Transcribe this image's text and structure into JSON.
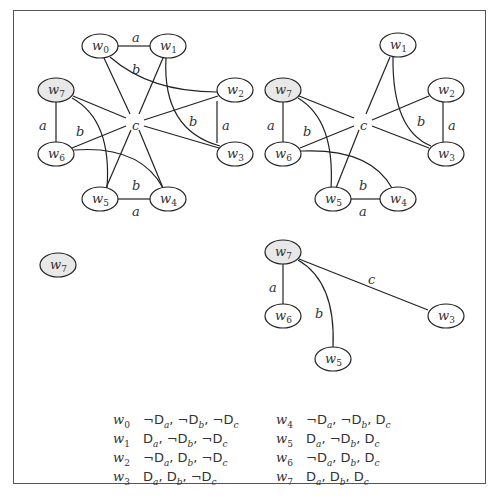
{
  "graphs": [
    {
      "id": "top-left",
      "center_label": "c",
      "nodes": [
        {
          "id": "w0",
          "label": "w",
          "sub": "0",
          "x": 100,
          "y": 46,
          "shaded": false
        },
        {
          "id": "w1",
          "label": "w",
          "sub": "1",
          "x": 168,
          "y": 46,
          "shaded": false
        },
        {
          "id": "w2",
          "label": "w",
          "sub": "2",
          "x": 235,
          "y": 90,
          "shaded": false
        },
        {
          "id": "w3",
          "label": "w",
          "sub": "3",
          "x": 235,
          "y": 154,
          "shaded": false
        },
        {
          "id": "w4",
          "label": "w",
          "sub": "4",
          "x": 168,
          "y": 199,
          "shaded": false
        },
        {
          "id": "w5",
          "label": "w",
          "sub": "5",
          "x": 100,
          "y": 199,
          "shaded": false
        },
        {
          "id": "w6",
          "label": "w",
          "sub": "6",
          "x": 56,
          "y": 154,
          "shaded": false
        },
        {
          "id": "w7",
          "label": "w",
          "sub": "7",
          "x": 56,
          "y": 90,
          "shaded": true
        }
      ],
      "edge_labels": [
        {
          "text": "a",
          "x": 135,
          "y": 38
        },
        {
          "text": "b",
          "x": 135,
          "y": 70
        },
        {
          "text": "a",
          "x": 42,
          "y": 126
        },
        {
          "text": "b",
          "x": 79,
          "y": 132
        },
        {
          "text": "c",
          "x": 135,
          "y": 126
        },
        {
          "text": "b",
          "x": 192,
          "y": 122
        },
        {
          "text": "a",
          "x": 225,
          "y": 126
        },
        {
          "text": "b",
          "x": 135,
          "y": 186
        },
        {
          "text": "a",
          "x": 135,
          "y": 212
        }
      ]
    },
    {
      "id": "top-right",
      "center_label": "c",
      "nodes": [
        {
          "id": "w1",
          "label": "w",
          "sub": "1",
          "x": 398,
          "y": 45,
          "shaded": false
        },
        {
          "id": "w2",
          "label": "w",
          "sub": "2",
          "x": 446,
          "y": 90,
          "shaded": false
        },
        {
          "id": "w3",
          "label": "w",
          "sub": "3",
          "x": 446,
          "y": 154,
          "shaded": false
        },
        {
          "id": "w4",
          "label": "w",
          "sub": "4",
          "x": 398,
          "y": 199,
          "shaded": false
        },
        {
          "id": "w5",
          "label": "w",
          "sub": "5",
          "x": 333,
          "y": 199,
          "shaded": false
        },
        {
          "id": "w6",
          "label": "w",
          "sub": "6",
          "x": 283,
          "y": 154,
          "shaded": false
        },
        {
          "id": "w7",
          "label": "w",
          "sub": "7",
          "x": 283,
          "y": 90,
          "shaded": true
        }
      ],
      "edge_labels": [
        {
          "text": "a",
          "x": 270,
          "y": 126
        },
        {
          "text": "b",
          "x": 306,
          "y": 132
        },
        {
          "text": "c",
          "x": 363,
          "y": 126
        },
        {
          "text": "b",
          "x": 420,
          "y": 122
        },
        {
          "text": "a",
          "x": 451,
          "y": 126
        },
        {
          "text": "b",
          "x": 362,
          "y": 186
        },
        {
          "text": "a",
          "x": 362,
          "y": 212
        }
      ]
    },
    {
      "id": "bottom-left",
      "nodes": [
        {
          "id": "w7",
          "label": "w",
          "sub": "7",
          "x": 58,
          "y": 265,
          "shaded": true
        }
      ],
      "edge_labels": []
    },
    {
      "id": "bottom-right",
      "nodes": [
        {
          "id": "w7",
          "label": "w",
          "sub": "7",
          "x": 283,
          "y": 252,
          "shaded": true
        },
        {
          "id": "w6",
          "label": "w",
          "sub": "6",
          "x": 283,
          "y": 316,
          "shaded": false
        },
        {
          "id": "w5",
          "label": "w",
          "sub": "5",
          "x": 333,
          "y": 359,
          "shaded": false
        },
        {
          "id": "w3",
          "label": "w",
          "sub": "3",
          "x": 446,
          "y": 316,
          "shaded": false
        }
      ],
      "edge_labels": [
        {
          "text": "a",
          "x": 272,
          "y": 288
        },
        {
          "text": "b",
          "x": 318,
          "y": 314
        },
        {
          "text": "c",
          "x": 371,
          "y": 280
        }
      ]
    }
  ],
  "legend": {
    "left": [
      {
        "world": "w",
        "sub": "0",
        "valuation": "¬Da, ¬Db, ¬Dc",
        "parts": [
          [
            "¬D",
            "a"
          ],
          [
            "¬D",
            "b"
          ],
          [
            "¬D",
            "c"
          ]
        ]
      },
      {
        "world": "w",
        "sub": "1",
        "valuation": "Da, ¬Db, ¬Dc",
        "parts": [
          [
            "D",
            "a"
          ],
          [
            "¬D",
            "b"
          ],
          [
            "¬D",
            "c"
          ]
        ]
      },
      {
        "world": "w",
        "sub": "2",
        "valuation": "¬Da, Db, ¬Dc",
        "parts": [
          [
            "¬D",
            "a"
          ],
          [
            "D",
            "b"
          ],
          [
            "¬D",
            "c"
          ]
        ]
      },
      {
        "world": "w",
        "sub": "3",
        "valuation": "Da, Db, ¬Dc",
        "parts": [
          [
            "D",
            "a"
          ],
          [
            "D",
            "b"
          ],
          [
            "¬D",
            "c"
          ]
        ]
      }
    ],
    "right": [
      {
        "world": "w",
        "sub": "4",
        "valuation": "¬Da, ¬Db, Dc",
        "parts": [
          [
            "¬D",
            "a"
          ],
          [
            "¬D",
            "b"
          ],
          [
            "D",
            "c"
          ]
        ]
      },
      {
        "world": "w",
        "sub": "5",
        "valuation": "Da, ¬Db, Dc",
        "parts": [
          [
            "D",
            "a"
          ],
          [
            "¬D",
            "b"
          ],
          [
            "D",
            "c"
          ]
        ]
      },
      {
        "world": "w",
        "sub": "6",
        "valuation": "¬Da, Db, Dc",
        "parts": [
          [
            "¬D",
            "a"
          ],
          [
            "D",
            "b"
          ],
          [
            "D",
            "c"
          ]
        ]
      },
      {
        "world": "w",
        "sub": "7",
        "valuation": "Da, Db, Dc",
        "parts": [
          [
            "D",
            "a"
          ],
          [
            "D",
            "b"
          ],
          [
            "D",
            "c"
          ]
        ]
      }
    ]
  },
  "colors": {
    "shaded_node": "#e8e8e8",
    "stroke": "#222222",
    "frame": "#555555"
  }
}
